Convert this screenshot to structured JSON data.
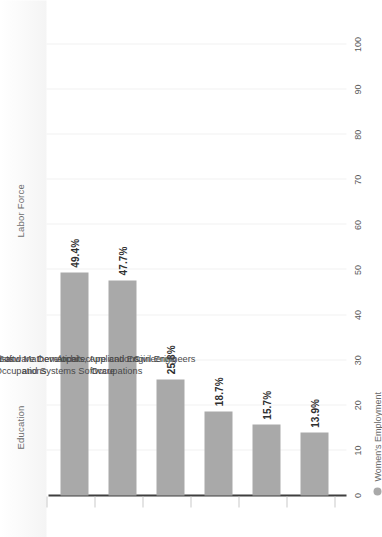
{
  "chart_data": {
    "type": "bar",
    "title": "",
    "subtitle": "",
    "orientation": "vertical-bars-rotated-90",
    "categories": [
      "Life, Physical, and Social Science\nOccupations",
      "Biological Scientists",
      "Computer and Mathematical\nOccupations",
      "Software Developers, Applications\nand Systems Software",
      "Architecture and Engineering\nOccupations",
      "Civil Engineers"
    ],
    "values": [
      49.4,
      47.7,
      25.8,
      18.7,
      15.7,
      13.9
    ],
    "value_labels": [
      "49.4%",
      "47.7%",
      "25.8%",
      "18.7%",
      "15.7%",
      "13.9%"
    ],
    "series": [
      {
        "name": "Women's Employment",
        "color": "#a9a9a9",
        "values": [
          49.4,
          47.7,
          25.8,
          18.7,
          15.7,
          13.9
        ]
      }
    ],
    "xlabel": "",
    "ylabel": "",
    "xlim": [
      0,
      100
    ],
    "x_ticks": [
      0,
      10,
      20,
      30,
      40,
      50,
      60,
      70,
      80,
      90,
      100
    ],
    "x_tick_labels": [
      "0",
      "10",
      "20",
      "30",
      "40",
      "50",
      "60",
      "70",
      "80",
      "90",
      "100"
    ],
    "grid": true,
    "legend_position": "bottom-left",
    "legend": [
      {
        "label": "Women's Employment",
        "color": "#a9a9a9",
        "marker": "circle"
      }
    ]
  },
  "header": {
    "columns": [
      {
        "label": "Education"
      },
      {
        "label": "Labor Force"
      }
    ]
  },
  "colors": {
    "bar": "#a9a9a9",
    "axis": "#3f3f3f",
    "grid": "#f2f2f2",
    "header_band": "#f4f4f4",
    "label_text": "#2e2e2e",
    "tick_text": "#5a5a5a",
    "category_text": "#4a4a4a",
    "header_text": "#6d6d6d"
  }
}
